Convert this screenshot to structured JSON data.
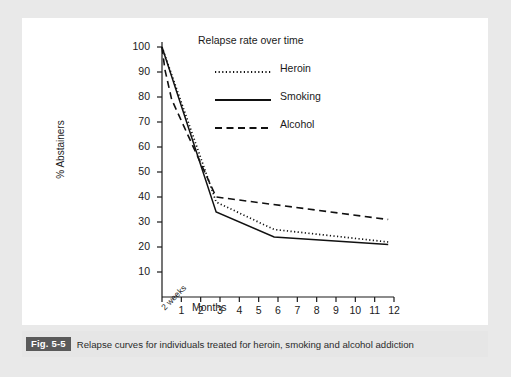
{
  "figure": {
    "caption_badge": "Fig. 5-5",
    "caption_text": "Relapse curves for individuals treated for heroin, smoking and alcohol addiction"
  },
  "colors": {
    "page_background": "#e9e9e9",
    "plate_background": "#ffffff",
    "caption_strip": "#e6e6e6",
    "caption_badge_bg": "#5a5a5a",
    "caption_badge_fg": "#ffffff",
    "ink": "#1a1a1a"
  },
  "chart_data": {
    "type": "line",
    "title": "Relapse rate over time",
    "xlabel": "Months",
    "ylabel": "% Abstainers",
    "xlim": [
      0,
      12
    ],
    "ylim": [
      0,
      102
    ],
    "grid": false,
    "legend_position": "top-center",
    "y_ticks": [
      100,
      90,
      80,
      70,
      60,
      50,
      40,
      30,
      20,
      10
    ],
    "x_ticks": [
      "2 weeks",
      "1",
      "2",
      "3",
      "4",
      "5",
      "6",
      "7",
      "8",
      "9",
      "10",
      "11",
      "12"
    ],
    "x_tick_values": [
      0,
      1,
      2,
      3,
      4,
      5,
      6,
      7,
      8,
      9,
      10,
      11,
      12
    ],
    "series": [
      {
        "name": "Heroin",
        "style": "dotted",
        "x": [
          0,
          2.8,
          5.8,
          11.7
        ],
        "values": [
          100,
          38,
          27,
          22
        ]
      },
      {
        "name": "Smoking",
        "style": "solid",
        "x": [
          0,
          2.8,
          5.8,
          11.7
        ],
        "values": [
          100,
          34,
          24,
          21
        ]
      },
      {
        "name": "Alcohol",
        "style": "dashed",
        "x": [
          0,
          0.15,
          0.5,
          2.8,
          11.7
        ],
        "values": [
          100,
          91,
          79,
          40,
          31
        ]
      }
    ]
  }
}
